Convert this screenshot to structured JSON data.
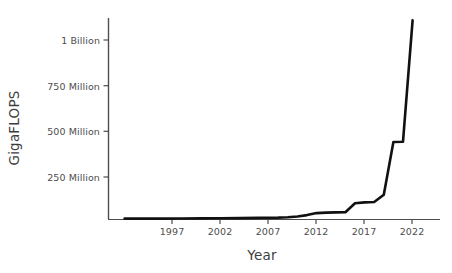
{
  "chart_data": {
    "type": "line",
    "title": "",
    "xlabel": "Year",
    "ylabel": "GigaFLOPS",
    "xlim": [
      1992,
      2023
    ],
    "ylim": [
      0,
      1150000000
    ],
    "grid": false,
    "legend": null,
    "xticks": [
      1997,
      2002,
      2007,
      2012,
      2017,
      2022
    ],
    "xtick_labels": [
      "1997",
      "2002",
      "2007",
      "2012",
      "2017",
      "2022"
    ],
    "yticks": [
      250000000,
      500000000,
      750000000,
      1000000000
    ],
    "ytick_labels": [
      "250 Million",
      "500 Million",
      "750 Million",
      "1 Billion"
    ],
    "line_color": "#111111",
    "line_width": 2.6,
    "series": [
      {
        "name": "Supercomputer performance",
        "x": [
          1992,
          1994,
          1996,
          1998,
          2000,
          2002,
          2004,
          2006,
          2008,
          2009,
          2010,
          2011,
          2012,
          2013,
          2014,
          2015,
          2016,
          2017,
          2018,
          2019,
          2020,
          2021,
          2022
        ],
        "values": [
          2000000,
          2000000,
          2500000,
          3000000,
          3500000,
          4000000,
          5000000,
          6000000,
          8000000,
          10000000,
          14000000,
          22000000,
          33000000,
          36000000,
          37000000,
          38000000,
          88000000,
          93000000,
          95000000,
          136000000,
          430000000,
          432000000,
          1110000000
        ]
      }
    ]
  },
  "axis": {
    "y_title": "GigaFLOPS",
    "x_title": "Year"
  }
}
